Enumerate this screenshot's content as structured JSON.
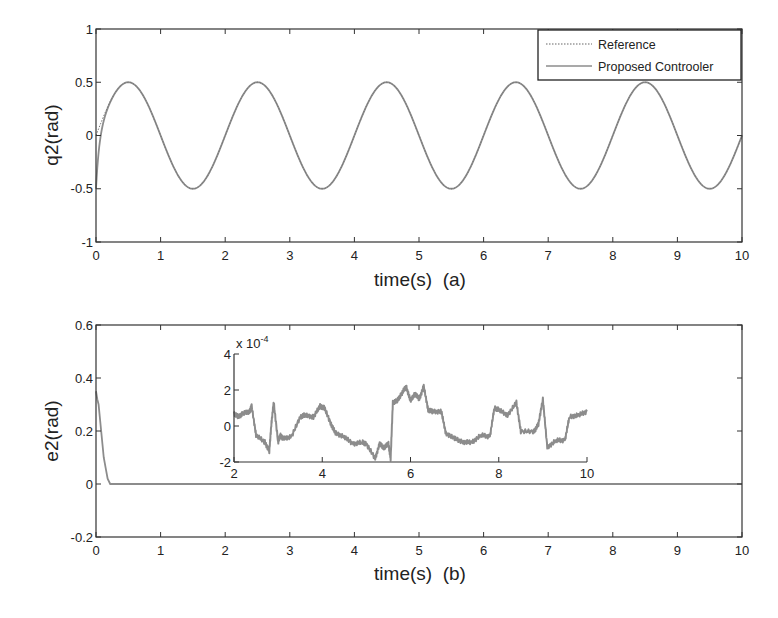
{
  "figure": {
    "background": "#ffffff",
    "axis_color": "#333333",
    "line_color": "#8c8c8c"
  },
  "chart_data": [
    {
      "id": "a",
      "type": "line",
      "title": "",
      "xlabel": "time(s)  (a)",
      "ylabel": "q2(rad)",
      "xlim": [
        0,
        10
      ],
      "ylim": [
        -1,
        1
      ],
      "xticks": [
        0,
        1,
        2,
        3,
        4,
        5,
        6,
        7,
        8,
        9,
        10
      ],
      "yticks": [
        -1,
        -0.5,
        0,
        0.5,
        1
      ],
      "ytick_labels": [
        "-1",
        "-0.5",
        "0",
        "0.5",
        "1"
      ],
      "grid": false,
      "legend": {
        "position": "upper right",
        "entries": [
          {
            "label": "Reference",
            "style": "dotted"
          },
          {
            "label": "Proposed Controoler",
            "style": "solid"
          }
        ]
      },
      "series": [
        {
          "name": "Reference",
          "description": "0.5*sin(pi*t)",
          "amplitude": 0.5,
          "period": 2.0,
          "x": [
            0,
            0.5,
            1,
            1.5,
            2,
            2.5,
            3,
            3.5,
            4,
            4.5,
            5,
            5.5,
            6,
            6.5,
            7,
            7.5,
            8,
            8.5,
            9,
            9.5,
            10
          ],
          "y": [
            0,
            0.5,
            0,
            -0.5,
            0,
            0.5,
            0,
            -0.5,
            0,
            0.5,
            0,
            -0.5,
            0,
            0.5,
            0,
            -0.5,
            0,
            0.5,
            0,
            -0.5,
            0
          ]
        },
        {
          "name": "Proposed Controoler",
          "description": "tracks reference after initial transient from -0.5 at t=0",
          "x": [
            0,
            0.02,
            0.05,
            0.1,
            0.2,
            0.3,
            0.5,
            1,
            1.5,
            2,
            2.5,
            3,
            3.5,
            4,
            4.5,
            5,
            5.5,
            6,
            6.5,
            7,
            7.5,
            8,
            8.5,
            9,
            9.5,
            10
          ],
          "y": [
            -0.5,
            -0.15,
            0.05,
            0.18,
            0.32,
            0.42,
            0.5,
            0,
            -0.5,
            0,
            0.5,
            0,
            -0.5,
            0,
            0.5,
            0,
            -0.5,
            0,
            0.5,
            0,
            -0.5,
            0,
            0.5,
            0,
            -0.5,
            0
          ]
        }
      ]
    },
    {
      "id": "b",
      "type": "line",
      "title": "",
      "xlabel": "time(s)  (b)",
      "ylabel": "e2(rad)",
      "xlim": [
        0,
        10
      ],
      "ylim": [
        -0.2,
        0.6
      ],
      "xticks": [
        0,
        1,
        2,
        3,
        4,
        5,
        6,
        7,
        8,
        9,
        10
      ],
      "yticks": [
        -0.2,
        0,
        0.2,
        0.4,
        0.6
      ],
      "ytick_labels": [
        "-0.2",
        "0",
        "0.2",
        "0.4",
        "0.6"
      ],
      "grid": false,
      "series": [
        {
          "name": "e2",
          "x": [
            0,
            0.02,
            0.04,
            0.06,
            0.08,
            0.1,
            0.12,
            0.15,
            0.18,
            0.22,
            0.3,
            1,
            2,
            3,
            4,
            5,
            6,
            7,
            8,
            9,
            10
          ],
          "y": [
            0.35,
            0.32,
            0.3,
            0.25,
            0.2,
            0.15,
            0.1,
            0.06,
            0.02,
            0.0,
            0.0,
            0,
            0,
            0,
            0,
            0,
            0,
            0,
            0,
            0,
            0
          ]
        }
      ],
      "inset": {
        "type": "line",
        "xlim": [
          2,
          10
        ],
        "ylim": [
          -2,
          4
        ],
        "xticks": [
          2,
          4,
          6,
          8,
          10
        ],
        "yticks": [
          -2,
          0,
          2,
          4
        ],
        "scale_label": "x 10",
        "scale_exponent": "-4",
        "series": [
          {
            "name": "e2 (zoom, x1e-4)",
            "x": [
              2.0,
              2.1,
              2.2,
              2.35,
              2.4,
              2.5,
              2.7,
              2.8,
              2.85,
              2.9,
              3.0,
              3.05,
              3.1,
              3.3,
              3.5,
              3.6,
              3.8,
              3.95,
              4.05,
              4.2,
              4.3,
              4.5,
              4.7,
              4.9,
              5.0,
              5.2,
              5.3,
              5.4,
              5.5,
              5.55,
              5.6,
              5.7,
              5.8,
              5.9,
              6.0,
              6.1,
              6.2,
              6.3,
              6.4,
              6.5,
              6.7,
              6.8,
              7.0,
              7.2,
              7.4,
              7.6,
              7.8,
              7.9,
              8.0,
              8.2,
              8.4,
              8.5,
              8.8,
              8.9,
              9.0,
              9.1,
              9.3,
              9.5,
              9.6,
              9.8,
              10.0
            ],
            "y": [
              0.7,
              0.5,
              0.7,
              0.8,
              1.1,
              -0.5,
              -0.9,
              -1.4,
              0.2,
              1.3,
              -0.9,
              -0.5,
              -0.7,
              -0.6,
              0.5,
              0.6,
              0.5,
              1.1,
              1.0,
              0.1,
              -0.4,
              -0.6,
              -1.0,
              -0.9,
              -1.0,
              -1.8,
              -1.0,
              -1.2,
              -1.0,
              -1.8,
              1.3,
              1.4,
              1.8,
              2.2,
              1.4,
              1.8,
              1.5,
              2.2,
              0.9,
              0.8,
              0.8,
              -0.4,
              -0.7,
              -0.9,
              -0.9,
              -0.5,
              -0.6,
              1.0,
              0.9,
              0.6,
              1.3,
              -0.3,
              -0.3,
              0.1,
              1.5,
              -1.2,
              -0.8,
              -0.8,
              0.5,
              0.6,
              0.8
            ]
          }
        ]
      }
    }
  ]
}
